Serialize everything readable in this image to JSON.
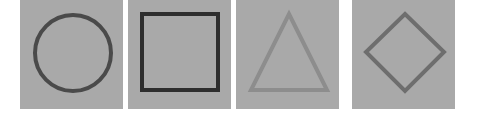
{
  "canvas": {
    "width": 477,
    "height": 117,
    "background_color": "#ffffff"
  },
  "panels": [
    {
      "name": "circle",
      "label": "Circle",
      "panel_fill": "#a9a9a9",
      "stroke_color": "#4a4a4a",
      "stroke_width": 4,
      "x": 20,
      "y": 0,
      "width": 103,
      "height": 109,
      "geometry": {
        "cx": 53,
        "cy": 53,
        "r": 38
      }
    },
    {
      "name": "square",
      "label": "Square",
      "panel_fill": "#a9a9a9",
      "stroke_color": "#2e2e2e",
      "stroke_width": 4,
      "x": 128,
      "y": 0,
      "width": 103,
      "height": 109,
      "geometry": {
        "x": 14,
        "y": 14,
        "w": 76,
        "h": 76
      }
    },
    {
      "name": "triangle",
      "label": "Triangle",
      "panel_fill": "#a9a9a9",
      "stroke_color": "#8d8d8d",
      "stroke_width": 4,
      "x": 236,
      "y": 0,
      "width": 103,
      "height": 109,
      "geometry": {
        "points": "53,14 91,90 15,90"
      }
    },
    {
      "name": "diamond",
      "label": "Diamond",
      "panel_fill": "#a9a9a9",
      "stroke_color": "#6e6e6e",
      "stroke_width": 4,
      "x": 352,
      "y": 0,
      "width": 103,
      "height": 109,
      "geometry": {
        "points": "53,14 92,52 53,91 14,52"
      }
    }
  ]
}
